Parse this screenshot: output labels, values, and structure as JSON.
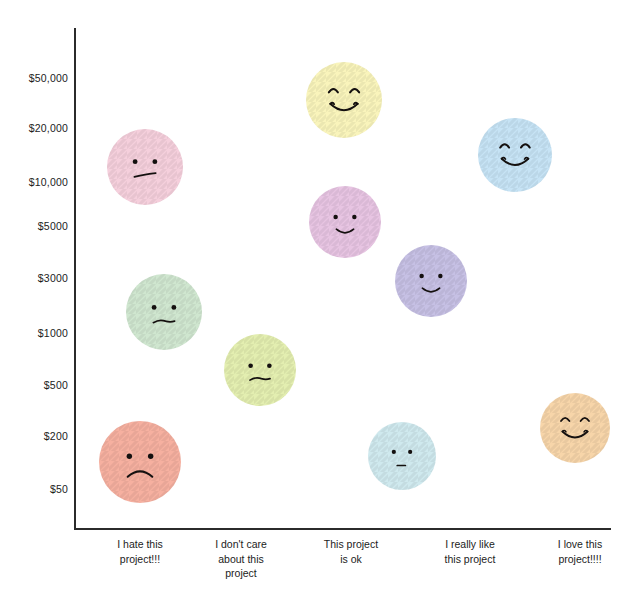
{
  "chart_data": {
    "type": "scatter",
    "title": "",
    "xlabel": "",
    "ylabel": "",
    "grid": false,
    "legend": null,
    "y_axis": {
      "scale": "log-like ordinal",
      "tick_labels": [
        "$50,000",
        "$20,000",
        "$10,000",
        "$5000",
        "$3000",
        "$1000",
        "$500",
        "$200",
        "$50"
      ],
      "tick_values": [
        50000,
        20000,
        10000,
        5000,
        3000,
        1000,
        500,
        200,
        50
      ],
      "tick_y_px": [
        78,
        128,
        182,
        226,
        278,
        333,
        385,
        436,
        489
      ]
    },
    "x_axis": {
      "categories": [
        "I hate this project!!!",
        "I don't care about this project",
        "This project is ok",
        "I really like this project",
        "I love this project!!!!"
      ],
      "category_x_px": [
        140,
        241,
        351,
        470,
        580
      ]
    },
    "points": [
      {
        "category": "I hate this project!!!",
        "value": 100,
        "label_y": "between $50 and $200",
        "expression": "sad",
        "color": "#f6b0a0",
        "x_px": 140,
        "y_px": 462,
        "r_px": 41
      },
      {
        "category": "I hate this project!!!",
        "value": 1800,
        "label_y": "between $1000 and $3000",
        "expression": "frown",
        "color": "#cfe6cf",
        "x_px": 164,
        "y_px": 312,
        "r_px": 38
      },
      {
        "category": "I hate this project!!!",
        "value": 14000,
        "label_y": "between $10,000 and $20,000",
        "expression": "wry-frown",
        "color": "#f5cfdc",
        "x_px": 145,
        "y_px": 167,
        "r_px": 38
      },
      {
        "category": "I don't care about this project",
        "value": 700,
        "label_y": "between $500 and $1000",
        "expression": "frown",
        "color": "#e3eeb0",
        "x_px": 260,
        "y_px": 370,
        "r_px": 36
      },
      {
        "category": "This project is ok",
        "value": 40000,
        "label_y": "near $50,000",
        "expression": "very-happy",
        "color": "#f9f4bb",
        "x_px": 344,
        "y_px": 100,
        "r_px": 38
      },
      {
        "category": "This project is ok",
        "value": 6000,
        "label_y": "between $5000 and $10,000",
        "expression": "happy",
        "color": "#e7c4e2",
        "x_px": 345,
        "y_px": 222,
        "r_px": 36
      },
      {
        "category": "This project is ok",
        "value": 120,
        "label_y": "between $50 and $200",
        "expression": "neutral",
        "color": "#cfe9ee",
        "x_px": 402,
        "y_px": 456,
        "r_px": 34
      },
      {
        "category": "I really like this project",
        "value": 3000,
        "label_y": "near $3000",
        "expression": "happy",
        "color": "#c6c0e4",
        "x_px": 431,
        "y_px": 281,
        "r_px": 36
      },
      {
        "category": "I really like this project",
        "value": 17000,
        "label_y": "between $10,000 and $20,000",
        "expression": "very-happy",
        "color": "#c6e3f5",
        "x_px": 515,
        "y_px": 155,
        "r_px": 37
      },
      {
        "category": "I love this project!!!!",
        "value": 250,
        "label_y": "between $200 and $500",
        "expression": "very-happy",
        "color": "#f7d5a9",
        "x_px": 575,
        "y_px": 428,
        "r_px": 35
      }
    ]
  }
}
